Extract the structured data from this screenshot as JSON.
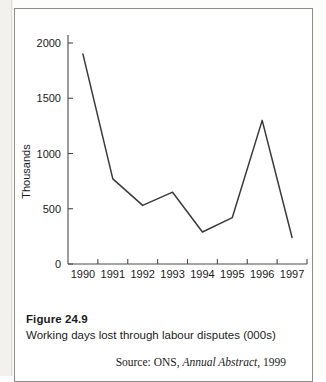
{
  "figure": {
    "number": "Figure 24.9",
    "title": "Working days lost through labour disputes (000s)",
    "source_prefix": "Source: ONS, ",
    "source_work": "Annual Abstract",
    "source_suffix": ", 1999"
  },
  "colors": {
    "line": "#3a3a3a",
    "axis": "#4a4a4a",
    "text": "#1b1b1b",
    "frame": "#8f8d88",
    "page": "#ffffff"
  },
  "chart_data": {
    "type": "line",
    "title": "",
    "xlabel": "",
    "ylabel": "Thousands",
    "categories": [
      "1990",
      "1991",
      "1992",
      "1993",
      "1994",
      "1995",
      "1996",
      "1997"
    ],
    "values": [
      1900,
      770,
      530,
      650,
      290,
      420,
      1300,
      240
    ],
    "series": [
      {
        "name": "Working days lost",
        "values": [
          1900,
          770,
          530,
          650,
          290,
          420,
          1300,
          240
        ]
      }
    ],
    "ylim": [
      0,
      2000
    ],
    "yticks": [
      0,
      500,
      1000,
      1500,
      2000
    ],
    "ytick_labels": [
      "0",
      "500",
      "1000",
      "1500",
      "2000"
    ],
    "grid": false,
    "legend": false,
    "legend_position": "none"
  }
}
